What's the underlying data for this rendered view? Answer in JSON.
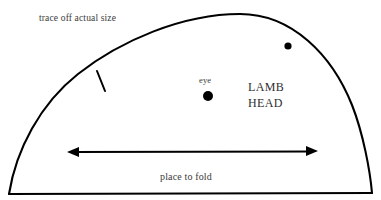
{
  "diagram": {
    "title_text": "LAMB HEAD",
    "background_color": "#ffffff",
    "ink_color": "#000000",
    "text_color": "#3a3a3a",
    "labels": {
      "trace_note": "trace off actual size",
      "eye": "eye",
      "animal_line1": "LAMB",
      "animal_line2": "HEAD",
      "fold_note": "place to fold"
    },
    "markers": {
      "eye_dot": {
        "cx": 208,
        "cy": 96,
        "r": 5
      },
      "ear_dot": {
        "cx": 288,
        "cy": 46,
        "r": 3.6
      },
      "notch_tick": {
        "x1": 97,
        "y1": 71,
        "x2": 105,
        "y2": 91
      }
    },
    "measure_arrow": {
      "x1": 68,
      "x2": 317,
      "y": 152,
      "heads": "both"
    },
    "outline": {
      "bottom_left": [
        9,
        194
      ],
      "bottom_right": [
        372,
        193
      ],
      "apex": [
        240,
        14
      ]
    }
  }
}
